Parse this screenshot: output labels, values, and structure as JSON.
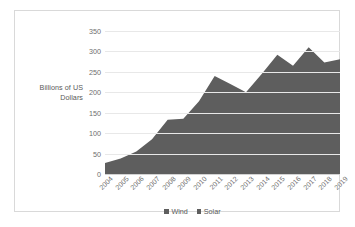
{
  "chart_data": {
    "type": "area",
    "title": "",
    "xlabel": "",
    "ylabel": "Billions of US Dollars",
    "ylim": [
      0,
      350
    ],
    "yticks": [
      0,
      50,
      100,
      150,
      200,
      250,
      300,
      350
    ],
    "grid": true,
    "legend_position": "bottom",
    "stacked": true,
    "categories": [
      "2004",
      "2005",
      "2006",
      "2007",
      "2008",
      "2009",
      "2010",
      "2011",
      "2012",
      "2013",
      "2014",
      "2015",
      "2016",
      "2017",
      "2018",
      "2019"
    ],
    "series": [
      {
        "name": "Wind",
        "color": "#5e5e5e",
        "values": [
          27,
          38,
          55,
          85,
          133,
          135,
          178,
          240,
          220,
          200,
          245,
          292,
          265,
          310,
          273,
          281
        ]
      },
      {
        "name": "Solar",
        "color": "#5e5e5e",
        "values": [
          0,
          0,
          0,
          0,
          0,
          0,
          0,
          0,
          0,
          0,
          0,
          0,
          0,
          0,
          0,
          0
        ]
      }
    ],
    "totals": [
      27,
      38,
      55,
      85,
      133,
      135,
      178,
      240,
      220,
      200,
      245,
      292,
      265,
      310,
      273,
      281
    ]
  },
  "legend": {
    "items": [
      {
        "label": "Wind",
        "color": "#5e5e5e"
      },
      {
        "label": "Solar",
        "color": "#5e5e5e"
      }
    ]
  },
  "colors": {
    "area_fill": "#5e5e5e",
    "gridline": "#e8e8e8",
    "baseline": "#d2d2d2",
    "tick_text": "#6e6e6e",
    "frame_border": "#d9d9d9",
    "background": "#ffffff"
  }
}
